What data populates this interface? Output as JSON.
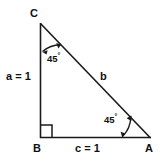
{
  "figure": {
    "type": "right-triangle-diagram",
    "stroke_color": "#1a1a1a",
    "text_color": "#111111",
    "background_color": "#ffffff",
    "width": 164,
    "height": 165
  },
  "vertices": [
    {
      "name": "C",
      "label": "C",
      "x": 40,
      "y": 23
    },
    {
      "name": "B",
      "label": "B",
      "x": 40,
      "y": 138
    },
    {
      "name": "A",
      "label": "A",
      "x": 150,
      "y": 138
    }
  ],
  "sides": [
    {
      "name": "a",
      "label": "a = 1",
      "between": "B-C",
      "value": 1
    },
    {
      "name": "b",
      "label": "b",
      "between": "C-A"
    },
    {
      "name": "c",
      "label": "c = 1",
      "between": "B-A",
      "value": 1
    }
  ],
  "angles": [
    {
      "at": "C",
      "label": "45",
      "degree_symbol": "°",
      "full_label": "45°",
      "value": 45,
      "marker": "double-headed-arc"
    },
    {
      "at": "A",
      "label": "45",
      "degree_symbol": "°",
      "full_label": "45°",
      "value": 45,
      "marker": "double-headed-arc"
    },
    {
      "at": "B",
      "label": "",
      "value": 90,
      "marker": "right-angle-square"
    }
  ]
}
